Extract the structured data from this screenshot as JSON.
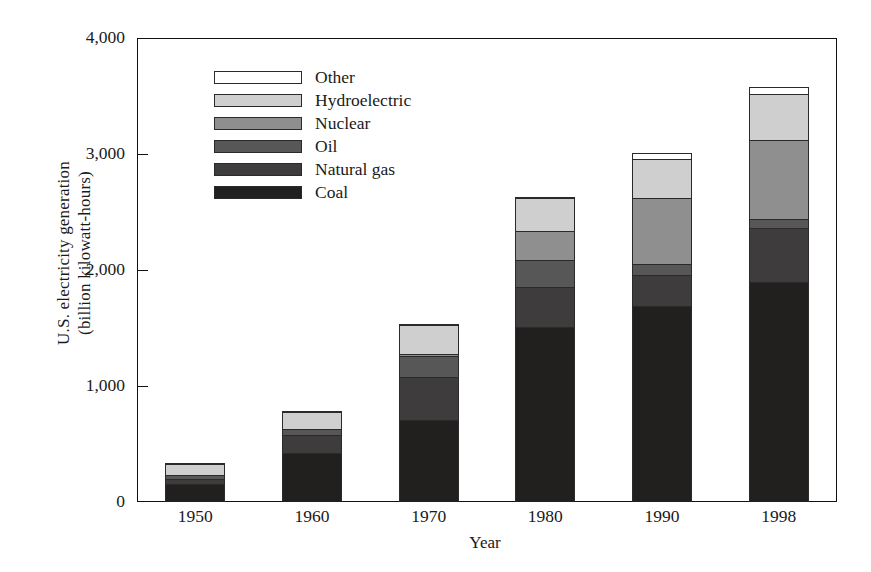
{
  "chart_data": {
    "type": "bar",
    "stacked": true,
    "title": "",
    "xlabel": "Year",
    "ylabel": "U.S. electricity generation\n(billion kilowatt-hours)",
    "categories": [
      "1950",
      "1960",
      "1970",
      "1980",
      "1990",
      "1998"
    ],
    "ylim": [
      0,
      4000
    ],
    "yticks": [
      0,
      1000,
      2000,
      3000,
      4000
    ],
    "ytick_labels": [
      "0",
      "1,000",
      "2,000",
      "3,000",
      "4,000"
    ],
    "grid": false,
    "legend_position": "upper-left-inside",
    "series": [
      {
        "name": "Coal",
        "color": "#221f1f",
        "values": [
          155,
          420,
          705,
          1510,
          1690,
          1900
        ]
      },
      {
        "name": "Natural gas",
        "color": "#3e3c3c",
        "values": [
          45,
          160,
          375,
          340,
          265,
          460
        ]
      },
      {
        "name": "Oil",
        "color": "#585757",
        "values": [
          35,
          50,
          180,
          240,
          100,
          80
        ]
      },
      {
        "name": "Nuclear",
        "color": "#8f8f8f",
        "values": [
          0,
          0,
          20,
          250,
          570,
          680
        ]
      },
      {
        "name": "Hydroelectric",
        "color": "#cfcfcf",
        "values": [
          90,
          150,
          250,
          280,
          330,
          400
        ]
      },
      {
        "name": "Other",
        "color": "#ffffff",
        "values": [
          5,
          5,
          5,
          10,
          50,
          60
        ]
      }
    ],
    "totals": [
      330,
      785,
      1535,
      2630,
      3005,
      3580
    ]
  },
  "legend": {
    "entries": [
      {
        "label": "Other"
      },
      {
        "label": "Hydroelectric"
      },
      {
        "label": "Nuclear"
      },
      {
        "label": "Oil"
      },
      {
        "label": "Natural gas"
      },
      {
        "label": "Coal"
      }
    ]
  }
}
